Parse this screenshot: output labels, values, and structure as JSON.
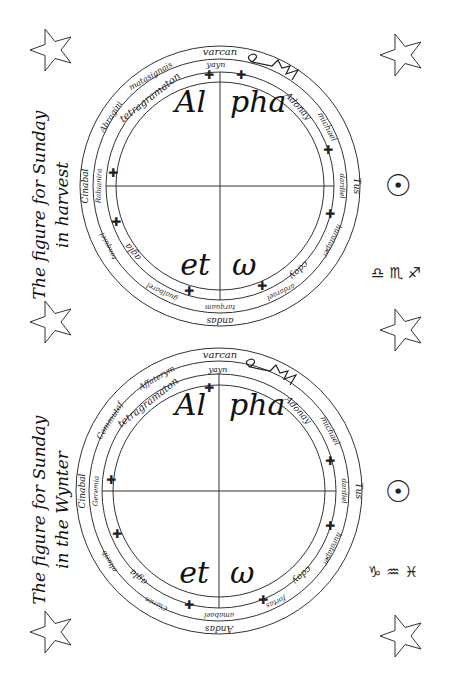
{
  "figures": [
    {
      "title_line1": "The figure for Sunday",
      "title_line2": "in harvest",
      "center": {
        "x": 220,
        "y": 186
      },
      "outer_ring": [
        "varcan",
        "Tus",
        "andas",
        "Cinabal"
      ],
      "middle_ring": [
        "yayn",
        "matasignais",
        "Abragini",
        "Rabianira",
        "tonquiel",
        "gualbarel",
        "tarquam",
        "ardarael",
        "hurataper",
        "dardiel",
        "michael"
      ],
      "inner_ring": [
        "tetragramaton",
        "Adonay",
        "cdoy",
        "agla"
      ],
      "quadrants": [
        "Al",
        "pha",
        "et",
        "ω"
      ],
      "planet_symbol": "☉",
      "zodiac_symbols": "♎ ♏ ♐"
    },
    {
      "title_line1": "The figure for Sunday",
      "title_line2": "in the Wynter",
      "center": {
        "x": 219,
        "y": 491
      },
      "outer_ring": [
        "varcan",
        "Tus",
        "Andas",
        "Cinabal"
      ],
      "middle_ring": [
        "yayn",
        "Affaterym",
        "Commutaf",
        "Geremia",
        "altarib",
        "Ciaran",
        "amabael",
        "fortas",
        "hurataper",
        "dardiel",
        "michael"
      ],
      "inner_ring": [
        "tetragramaton",
        "Adonay",
        "cdoy",
        "agla"
      ],
      "quadrants": [
        "Al",
        "pha",
        "et",
        "ω"
      ],
      "planet_symbol": "☉",
      "zodiac_symbols": "♑ ♒ ♓"
    }
  ],
  "sigil_label": "sigil"
}
